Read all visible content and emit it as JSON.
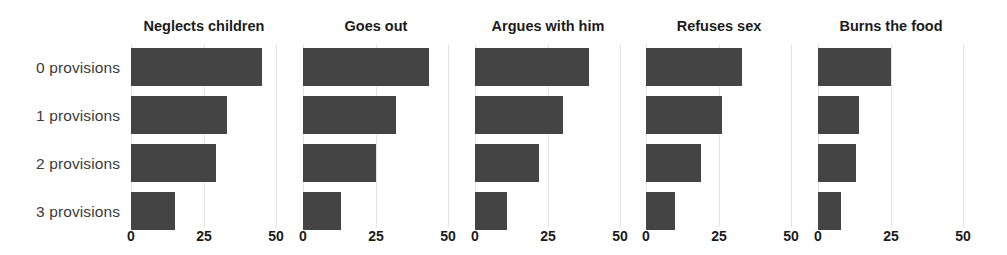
{
  "chart_data": {
    "type": "bar",
    "orientation": "horizontal",
    "title": "",
    "xlabel": "",
    "ylabel": "",
    "xlim": [
      0,
      50
    ],
    "xticks": [
      0,
      25,
      50
    ],
    "xtick_labels": [
      "0",
      "25",
      "50"
    ],
    "grid": true,
    "legend": "none",
    "bar_color": "#444444",
    "gridline_color": "#e4e4e4",
    "label_color": "#3b3b3b",
    "categories": [
      "0 provisions",
      "1 provisions",
      "2 provisions",
      "3 provisions"
    ],
    "panels": [
      {
        "title": "Neglects children",
        "values": [
          45,
          33,
          29,
          15
        ]
      },
      {
        "title": "Goes out",
        "values": [
          43,
          32,
          25,
          13
        ]
      },
      {
        "title": "Argues with him",
        "values": [
          39,
          30,
          22,
          11
        ]
      },
      {
        "title": "Refuses sex",
        "values": [
          33,
          26,
          19,
          10
        ]
      },
      {
        "title": "Burns the food",
        "values": [
          25,
          14,
          13,
          8
        ]
      }
    ]
  }
}
